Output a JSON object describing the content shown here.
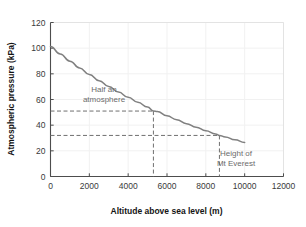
{
  "chart_data": {
    "type": "line",
    "title": "",
    "xlabel": "Altitude above sea level (m)",
    "ylabel": "Atmospheric pressure (kPa)",
    "xlim": [
      0,
      12000
    ],
    "ylim": [
      0,
      120
    ],
    "xticks": [
      0,
      2000,
      4000,
      6000,
      8000,
      10000,
      12000
    ],
    "yticks": [
      0,
      20,
      40,
      60,
      80,
      100,
      120
    ],
    "xtick_labels": [
      "0",
      "2000",
      "4000",
      "6000",
      "8000",
      "10000",
      "12000"
    ],
    "ytick_labels": [
      "0",
      "20",
      "40",
      "60",
      "80",
      "100",
      "120"
    ],
    "grid": true,
    "legend": "none",
    "series": [
      {
        "name": "Atmospheric pressure",
        "color": "#808080",
        "x": [
          0,
          500,
          1000,
          1500,
          2000,
          2500,
          3000,
          3500,
          4000,
          4500,
          5000,
          5300,
          5500,
          6000,
          6500,
          7000,
          7500,
          8000,
          8500,
          8700,
          9000,
          9500,
          10000
        ],
        "y": [
          101.3,
          95.5,
          89.9,
          84.6,
          79.5,
          74.7,
          70.1,
          65.8,
          61.7,
          57.8,
          54.1,
          51.0,
          50.6,
          47.3,
          44.2,
          41.2,
          38.4,
          35.7,
          33.2,
          32.0,
          30.8,
          28.6,
          26.5
        ]
      }
    ],
    "annotations": [
      {
        "id": "half-atmosphere",
        "text_lines": [
          "Half an",
          "atmosphere"
        ],
        "x": 5300,
        "y": 51,
        "guide_style": "dashed",
        "guide_color": "#707070"
      },
      {
        "id": "mt-everest",
        "text_lines": [
          "Height of",
          "Mt Everest"
        ],
        "x": 8700,
        "y": 32,
        "guide_style": "dashed",
        "guide_color": "#707070"
      }
    ],
    "colors": {
      "curve": "#808080",
      "grid": "#f1f1f1",
      "axis": "#4d4d4d",
      "tick_text": "#3a3a3a",
      "axis_title": "#141414",
      "annotation_text": "#6b6b6b",
      "background": "#ffffff"
    }
  }
}
